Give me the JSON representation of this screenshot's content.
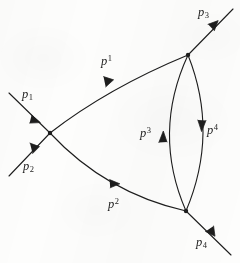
{
  "figure": {
    "kind": "feynman-diagram",
    "background_color": "#fdfdfc",
    "ink_color": "#1d1d1d",
    "stroke_width": 1.1
  },
  "labels": {
    "incoming_upper": {
      "base": "p",
      "sub": "1",
      "sup": "",
      "x": 22,
      "y": 88
    },
    "incoming_lower": {
      "base": "p",
      "sub": "2",
      "sup": "",
      "x": 23,
      "y": 160
    },
    "outgoing_upper": {
      "base": "p",
      "sub": "3",
      "sup": "",
      "x": 198,
      "y": 6
    },
    "outgoing_lower": {
      "base": "p",
      "sub": "4",
      "sup": "",
      "x": 196,
      "y": 236
    },
    "internal_upper": {
      "base": "p",
      "sub": "",
      "sup": "1",
      "x": 101,
      "y": 54
    },
    "internal_lower": {
      "base": "p",
      "sub": "",
      "sup": "2",
      "x": 108,
      "y": 197
    },
    "loop_left": {
      "base": "p",
      "sub": "",
      "sup": "3",
      "x": 140,
      "y": 126
    },
    "loop_right": {
      "base": "p",
      "sub": "",
      "sup": "4",
      "x": 207,
      "y": 123
    }
  },
  "vertices": [
    {
      "name": "left-vertex",
      "x": 50,
      "y": 133
    },
    {
      "name": "top-right-vertex",
      "x": 188,
      "y": 55
    },
    {
      "name": "bottom-right-vertex",
      "x": 186,
      "y": 211
    }
  ],
  "edges": [
    {
      "name": "incoming-p1",
      "shape": "line",
      "from": [
        9,
        93
      ],
      "to": [
        50,
        133
      ],
      "arrow_at": 0.66,
      "label": "incoming_upper"
    },
    {
      "name": "incoming-p2",
      "shape": "line",
      "from": [
        9,
        176
      ],
      "to": [
        50,
        133
      ],
      "arrow_at": 0.66,
      "label": "incoming_lower"
    },
    {
      "name": "outgoing-p3",
      "shape": "line",
      "from": [
        188,
        55
      ],
      "to": [
        233,
        9
      ],
      "arrow_at": 0.64,
      "label": "outgoing_upper"
    },
    {
      "name": "outgoing-p4",
      "shape": "line",
      "from": [
        186,
        211
      ],
      "to": [
        231,
        255
      ],
      "arrow_at": 0.62,
      "label": "outgoing_lower"
    },
    {
      "name": "internal-p1-upper",
      "shape": "arc",
      "from": [
        50,
        133
      ],
      "to": [
        188,
        55
      ],
      "bulge": "up",
      "arrow_at": 0.46,
      "label": "internal_upper"
    },
    {
      "name": "internal-p2-lower",
      "shape": "arc",
      "from": [
        50,
        133
      ],
      "to": [
        186,
        211
      ],
      "bulge": "down",
      "arrow_at": 0.56,
      "label": "internal_lower"
    },
    {
      "name": "loop-left-p3",
      "shape": "arc",
      "from": [
        186,
        211
      ],
      "to": [
        188,
        55
      ],
      "bulge": "left",
      "arrow_at": 0.5,
      "arrow_dir": "up",
      "label": "loop_left"
    },
    {
      "name": "loop-right-p4",
      "shape": "arc",
      "from": [
        188,
        55
      ],
      "to": [
        186,
        211
      ],
      "bulge": "right",
      "arrow_at": 0.5,
      "arrow_dir": "down",
      "label": "loop_right"
    }
  ]
}
